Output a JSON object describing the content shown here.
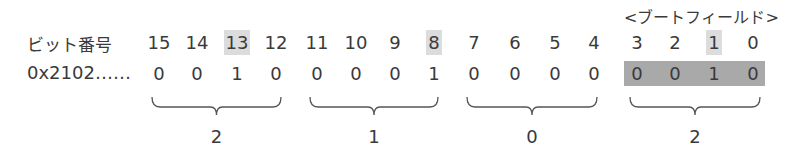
{
  "field_title": "<ブートフィールド>",
  "rows": {
    "bit_label": "ビット番号",
    "value_label": "0x2102……"
  },
  "bits": [
    {
      "num": "15",
      "val": "0",
      "x": 159,
      "highlight": false
    },
    {
      "num": "14",
      "val": "0",
      "x": 197,
      "highlight": false
    },
    {
      "num": "13",
      "val": "1",
      "x": 237,
      "highlight": true
    },
    {
      "num": "12",
      "val": "0",
      "x": 276,
      "highlight": false
    },
    {
      "num": "11",
      "val": "0",
      "x": 317,
      "highlight": false
    },
    {
      "num": "10",
      "val": "0",
      "x": 356,
      "highlight": false
    },
    {
      "num": "9",
      "val": "0",
      "x": 395,
      "highlight": false
    },
    {
      "num": "8",
      "val": "1",
      "x": 434,
      "highlight": true
    },
    {
      "num": "7",
      "val": "0",
      "x": 474,
      "highlight": false
    },
    {
      "num": "6",
      "val": "0",
      "x": 515,
      "highlight": false
    },
    {
      "num": "5",
      "val": "0",
      "x": 555,
      "highlight": false
    },
    {
      "num": "4",
      "val": "0",
      "x": 594,
      "highlight": false
    },
    {
      "num": "3",
      "val": "0",
      "x": 637,
      "highlight": false
    },
    {
      "num": "2",
      "val": "0",
      "x": 675,
      "highlight": false
    },
    {
      "num": "1",
      "val": "1",
      "x": 714,
      "highlight": true
    },
    {
      "num": "0",
      "val": "0",
      "x": 753,
      "highlight": false
    }
  ],
  "groups": [
    {
      "hex": "2",
      "x1": 152,
      "x2": 281
    },
    {
      "hex": "1",
      "x1": 310,
      "x2": 438
    },
    {
      "hex": "0",
      "x1": 467,
      "x2": 597
    },
    {
      "hex": "2",
      "x1": 630,
      "x2": 760
    }
  ],
  "colors": {
    "text": "#3a3a3a",
    "bit_highlight": "#dcdcdc",
    "boot_field_fill": "#a9a9a9",
    "brace": "#555555"
  }
}
